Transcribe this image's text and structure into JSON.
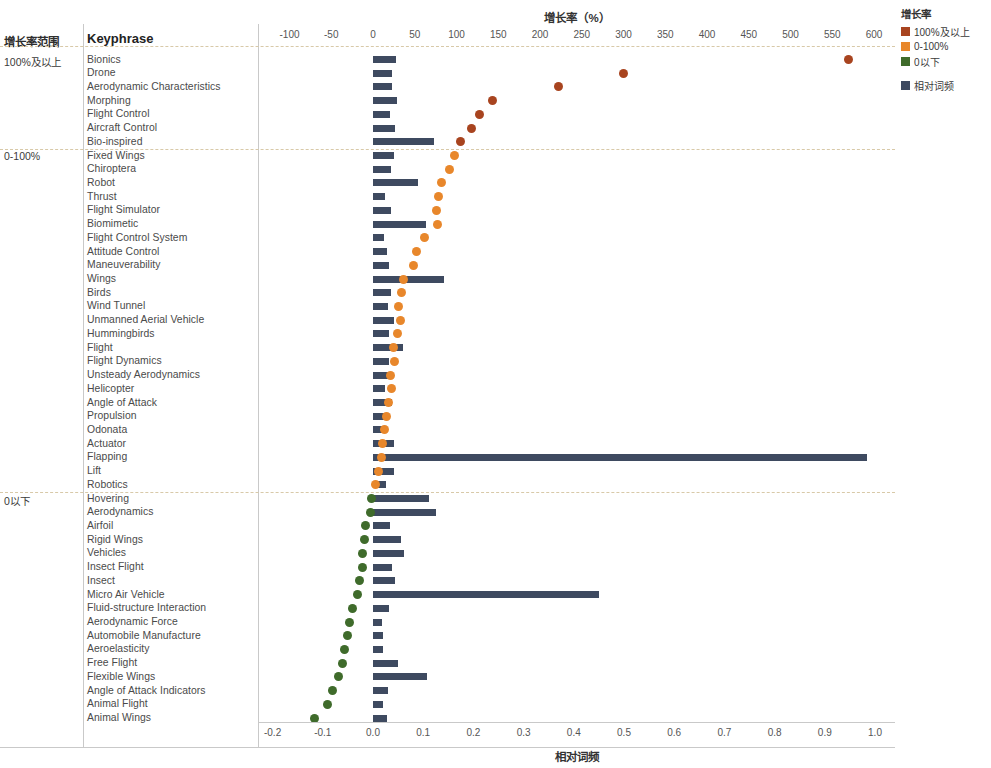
{
  "table": {
    "header_range": "增长率范围",
    "header_keyphrase": "Keyphrase",
    "groups": [
      {
        "label": "100%及以上"
      },
      {
        "label": "0-100%"
      },
      {
        "label": "0以下"
      }
    ]
  },
  "legend": {
    "title": "增长率",
    "items": [
      {
        "label": "100%及以上",
        "color": "#a8441f"
      },
      {
        "label": "0-100%",
        "color": "#e8872b"
      },
      {
        "label": "0以下",
        "color": "#3f6b2b"
      }
    ],
    "extra": [
      {
        "label": "相对词频",
        "color": "#3e4a60"
      }
    ]
  },
  "chart_data": {
    "type": "bar",
    "title": "增长率（%）",
    "top_axis_label": "增长率（%）",
    "bottom_axis_label": "相对词频",
    "top_axis_ticks": [
      "-100",
      "-50",
      "0",
      "50",
      "100",
      "150",
      "200",
      "250",
      "300",
      "350",
      "400",
      "450",
      "500",
      "550",
      "600"
    ],
    "top_axis_values": [
      -100,
      -50,
      0,
      50,
      100,
      150,
      200,
      250,
      300,
      350,
      400,
      450,
      500,
      550,
      600
    ],
    "top_xlim": [
      -125,
      625
    ],
    "bottom_axis_ticks": [
      "-0.2",
      "-0.1",
      "0.0",
      "0.1",
      "0.2",
      "0.3",
      "0.4",
      "0.5",
      "0.6",
      "0.7",
      "0.8",
      "0.9",
      "1.0"
    ],
    "bottom_axis_values": [
      -0.2,
      -0.1,
      0.0,
      0.1,
      0.2,
      0.3,
      0.4,
      0.5,
      0.6,
      0.7,
      0.8,
      0.9,
      1.0
    ],
    "bottom_xlim": [
      -0.23,
      1.04
    ],
    "grid": false,
    "legend_position": "top-right",
    "series": [
      {
        "name": "相对词频",
        "type": "bar",
        "color": "#3e4a60",
        "axis": "bottom"
      },
      {
        "name": "增长率",
        "type": "scatter",
        "axis": "top"
      }
    ],
    "rows": [
      {
        "group": "100%及以上",
        "keyphrase": "Bionics",
        "growth": 570,
        "freq": 0.045,
        "color": "#a8441f"
      },
      {
        "group": "100%及以上",
        "keyphrase": "Drone",
        "growth": 300,
        "freq": 0.038,
        "color": "#a8441f"
      },
      {
        "group": "100%及以上",
        "keyphrase": "Aerodynamic Characteristics",
        "growth": 222,
        "freq": 0.038,
        "color": "#a8441f"
      },
      {
        "group": "100%及以上",
        "keyphrase": "Morphing",
        "growth": 143,
        "freq": 0.048,
        "color": "#a8441f"
      },
      {
        "group": "100%及以上",
        "keyphrase": "Flight Control",
        "growth": 128,
        "freq": 0.034,
        "color": "#a8441f"
      },
      {
        "group": "100%及以上",
        "keyphrase": "Aircraft Control",
        "growth": 118,
        "freq": 0.044,
        "color": "#a8441f"
      },
      {
        "group": "100%及以上",
        "keyphrase": "Bio-inspired",
        "growth": 105,
        "freq": 0.122,
        "color": "#a8441f"
      },
      {
        "group": "0-100%",
        "keyphrase": "Fixed Wings",
        "growth": 98,
        "freq": 0.042,
        "color": "#e8872b"
      },
      {
        "group": "0-100%",
        "keyphrase": "Chiroptera",
        "growth": 92,
        "freq": 0.036,
        "color": "#e8872b"
      },
      {
        "group": "0-100%",
        "keyphrase": "Robot",
        "growth": 82,
        "freq": 0.09,
        "color": "#e8872b"
      },
      {
        "group": "0-100%",
        "keyphrase": "Thrust",
        "growth": 78,
        "freq": 0.023,
        "color": "#e8872b"
      },
      {
        "group": "0-100%",
        "keyphrase": "Flight Simulator",
        "growth": 76,
        "freq": 0.036,
        "color": "#e8872b"
      },
      {
        "group": "0-100%",
        "keyphrase": "Biomimetic",
        "growth": 77,
        "freq": 0.106,
        "color": "#e8872b"
      },
      {
        "group": "0-100%",
        "keyphrase": "Flight Control System",
        "growth": 62,
        "freq": 0.021,
        "color": "#e8872b"
      },
      {
        "group": "0-100%",
        "keyphrase": "Attitude Control",
        "growth": 52,
        "freq": 0.028,
        "color": "#e8872b"
      },
      {
        "group": "0-100%",
        "keyphrase": "Maneuverability",
        "growth": 48,
        "freq": 0.032,
        "color": "#e8872b"
      },
      {
        "group": "0-100%",
        "keyphrase": "Wings",
        "growth": 37,
        "freq": 0.142,
        "color": "#e8872b"
      },
      {
        "group": "0-100%",
        "keyphrase": "Birds",
        "growth": 34,
        "freq": 0.035,
        "color": "#e8872b"
      },
      {
        "group": "0-100%",
        "keyphrase": "Wind Tunnel",
        "growth": 30,
        "freq": 0.029,
        "color": "#e8872b"
      },
      {
        "group": "0-100%",
        "keyphrase": "Unmanned Aerial Vehicle",
        "growth": 33,
        "freq": 0.042,
        "color": "#e8872b"
      },
      {
        "group": "0-100%",
        "keyphrase": "Hummingbirds",
        "growth": 29,
        "freq": 0.032,
        "color": "#e8872b"
      },
      {
        "group": "0-100%",
        "keyphrase": "Flight",
        "growth": 25,
        "freq": 0.06,
        "color": "#e8872b"
      },
      {
        "group": "0-100%",
        "keyphrase": "Flight Dynamics",
        "growth": 26,
        "freq": 0.032,
        "color": "#e8872b"
      },
      {
        "group": "0-100%",
        "keyphrase": "Unsteady Aerodynamics",
        "growth": 21,
        "freq": 0.04,
        "color": "#e8872b"
      },
      {
        "group": "0-100%",
        "keyphrase": "Helicopter",
        "growth": 22,
        "freq": 0.024,
        "color": "#e8872b"
      },
      {
        "group": "0-100%",
        "keyphrase": "Angle of Attack",
        "growth": 18,
        "freq": 0.038,
        "color": "#e8872b"
      },
      {
        "group": "0-100%",
        "keyphrase": "Propulsion",
        "growth": 16,
        "freq": 0.027,
        "color": "#e8872b"
      },
      {
        "group": "0-100%",
        "keyphrase": "Odonata",
        "growth": 14,
        "freq": 0.018,
        "color": "#e8872b"
      },
      {
        "group": "0-100%",
        "keyphrase": "Actuator",
        "growth": 11,
        "freq": 0.042,
        "color": "#e8872b"
      },
      {
        "group": "0-100%",
        "keyphrase": "Flapping",
        "growth": 10,
        "freq": 0.985,
        "color": "#e8872b"
      },
      {
        "group": "0-100%",
        "keyphrase": "Lift",
        "growth": 7,
        "freq": 0.042,
        "color": "#e8872b"
      },
      {
        "group": "0-100%",
        "keyphrase": "Robotics",
        "growth": 3,
        "freq": 0.025,
        "color": "#e8872b"
      },
      {
        "group": "0以下",
        "keyphrase": "Hovering",
        "growth": -2,
        "freq": 0.112,
        "color": "#3f6b2b"
      },
      {
        "group": "0以下",
        "keyphrase": "Aerodynamics",
        "growth": -3,
        "freq": 0.125,
        "color": "#3f6b2b"
      },
      {
        "group": "0以下",
        "keyphrase": "Airfoil",
        "growth": -9,
        "freq": 0.033,
        "color": "#3f6b2b"
      },
      {
        "group": "0以下",
        "keyphrase": "Rigid Wings",
        "growth": -10,
        "freq": 0.055,
        "color": "#3f6b2b"
      },
      {
        "group": "0以下",
        "keyphrase": "Vehicles",
        "growth": -12,
        "freq": 0.062,
        "color": "#3f6b2b"
      },
      {
        "group": "0以下",
        "keyphrase": "Insect Flight",
        "growth": -13,
        "freq": 0.038,
        "color": "#3f6b2b"
      },
      {
        "group": "0以下",
        "keyphrase": "Insect",
        "growth": -16,
        "freq": 0.043,
        "color": "#3f6b2b"
      },
      {
        "group": "0以下",
        "keyphrase": "Micro Air Vehicle",
        "growth": -19,
        "freq": 0.45,
        "color": "#3f6b2b"
      },
      {
        "group": "0以下",
        "keyphrase": "Fluid-structure Interaction",
        "growth": -25,
        "freq": 0.031,
        "color": "#3f6b2b"
      },
      {
        "group": "0以下",
        "keyphrase": "Aerodynamic Force",
        "growth": -28,
        "freq": 0.018,
        "color": "#3f6b2b"
      },
      {
        "group": "0以下",
        "keyphrase": "Automobile Manufacture",
        "growth": -30,
        "freq": 0.02,
        "color": "#3f6b2b"
      },
      {
        "group": "0以下",
        "keyphrase": "Aeroelasticity",
        "growth": -34,
        "freq": 0.02,
        "color": "#3f6b2b"
      },
      {
        "group": "0以下",
        "keyphrase": "Free Flight",
        "growth": -36,
        "freq": 0.05,
        "color": "#3f6b2b"
      },
      {
        "group": "0以下",
        "keyphrase": "Flexible Wings",
        "growth": -41,
        "freq": 0.108,
        "color": "#3f6b2b"
      },
      {
        "group": "0以下",
        "keyphrase": "Angle of Attack Indicators",
        "growth": -48,
        "freq": 0.03,
        "color": "#3f6b2b"
      },
      {
        "group": "0以下",
        "keyphrase": "Animal Flight",
        "growth": -55,
        "freq": 0.019,
        "color": "#3f6b2b"
      },
      {
        "group": "0以下",
        "keyphrase": "Animal Wings",
        "growth": -70,
        "freq": 0.027,
        "color": "#3f6b2b"
      }
    ]
  }
}
